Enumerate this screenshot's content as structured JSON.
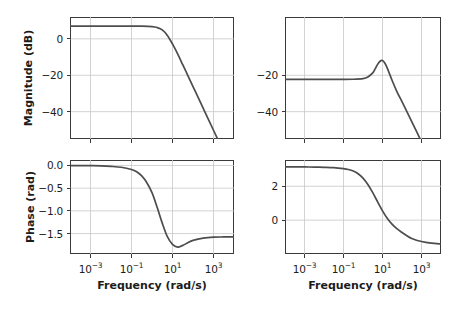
{
  "figure": {
    "type": "bode-plot-grid",
    "rows": 2,
    "cols": 2,
    "background": "#ffffff",
    "curve_color": "#4d4d4d",
    "grid_color": "#c8c8c8",
    "axis_color": "#3a3a3a"
  },
  "axis_titles": {
    "magnitude_y": "Magnitude (dB)",
    "phase_y": "Phase (rad)",
    "frequency_x": "Frequency (rad/s)"
  },
  "xticks": {
    "labels": [
      "10",
      "10",
      "10",
      "10"
    ],
    "exponents": [
      "−3",
      "−1",
      "1",
      "3"
    ],
    "values": [
      0.001,
      0.1,
      10,
      1000
    ]
  },
  "chart_data": [
    {
      "id": "magnitude-left",
      "type": "line",
      "title": "",
      "xlabel": "",
      "ylabel": "Magnitude (dB)",
      "xscale": "log",
      "xlim": [
        0.0001,
        10000
      ],
      "ylim": [
        -55,
        12
      ],
      "yticks": [
        0,
        -20,
        -40
      ],
      "ytick_labels": [
        "0",
        "−20",
        "−40"
      ],
      "xticks": [
        0.001,
        0.1,
        10,
        1000
      ],
      "xtick_labels": [
        "10⁻³",
        "10⁻¹",
        "10¹",
        "10³"
      ],
      "grid": true,
      "legend": "none",
      "series": [
        {
          "name": "Magnitude",
          "x": [
            0.0001,
            0.000316,
            0.001,
            0.00316,
            0.01,
            0.0316,
            0.1,
            0.316,
            1.0,
            1.78,
            3.16,
            5.62,
            10.0,
            17.8,
            31.6,
            56.2,
            100.0,
            178.0,
            316.0,
            562.0,
            1000.0,
            1780.0,
            3160.0,
            5620.0,
            10000.0
          ],
          "y": [
            7.0,
            7.0,
            7.0,
            7.0,
            7.0,
            7.0,
            7.0,
            6.95,
            6.7,
            6.2,
            4.9,
            1.9,
            -2.8,
            -8.3,
            -14.2,
            -20.2,
            -26.2,
            -32.2,
            -38.2,
            -44.2,
            -50.2,
            -56.2,
            -62.2,
            -68.2,
            -74.2
          ]
        }
      ]
    },
    {
      "id": "magnitude-right",
      "type": "line",
      "title": "",
      "xlabel": "",
      "ylabel": "",
      "xscale": "log",
      "xlim": [
        0.0001,
        10000
      ],
      "ylim": [
        -55,
        12
      ],
      "yticks": [
        -20,
        -40
      ],
      "ytick_labels": [
        "−20",
        "−40"
      ],
      "xticks": [
        0.001,
        0.1,
        10,
        1000
      ],
      "xtick_labels": [
        "10⁻³",
        "10⁻¹",
        "10¹",
        "10³"
      ],
      "grid": true,
      "legend": "none",
      "series": [
        {
          "name": "Magnitude",
          "x": [
            0.0001,
            0.000316,
            0.001,
            0.00316,
            0.01,
            0.0316,
            0.1,
            0.316,
            1.0,
            1.78,
            3.16,
            4.2,
            5.62,
            7.5,
            10.0,
            13.3,
            17.8,
            31.6,
            56.2,
            100.0,
            178.0,
            316.0,
            562.0,
            1000.0,
            1780.0,
            3160.0,
            5620.0,
            10000.0
          ],
          "y": [
            -22.3,
            -22.3,
            -22.3,
            -22.3,
            -22.3,
            -22.3,
            -22.3,
            -22.2,
            -21.8,
            -20.9,
            -18.7,
            -16.5,
            -14.0,
            -12.3,
            -11.9,
            -13.4,
            -16.2,
            -23.0,
            -29.2,
            -34.5,
            -40.0,
            -45.5,
            -51.0,
            -56.5,
            -62.0,
            -67.5,
            -73.0,
            -78.5
          ]
        }
      ]
    },
    {
      "id": "phase-left",
      "type": "line",
      "title": "",
      "xlabel": "Frequency (rad/s)",
      "ylabel": "Phase (rad)",
      "xscale": "log",
      "xlim": [
        0.0001,
        10000
      ],
      "ylim": [
        -1.95,
        0.12
      ],
      "yticks": [
        0.0,
        -0.5,
        -1.0,
        -1.5
      ],
      "ytick_labels": [
        "0.0",
        "−0.5",
        "−1.0",
        "−1.5"
      ],
      "xticks": [
        0.001,
        0.1,
        10,
        1000
      ],
      "xtick_labels": [
        "10⁻³",
        "10⁻¹",
        "10¹",
        "10³"
      ],
      "grid": true,
      "legend": "none",
      "series": [
        {
          "name": "Phase",
          "x": [
            0.0001,
            0.000316,
            0.001,
            0.00316,
            0.01,
            0.0316,
            0.1,
            0.178,
            0.316,
            0.562,
            1.0,
            1.78,
            3.16,
            5.62,
            10.0,
            17.8,
            31.6,
            56.2,
            100.0,
            316.0,
            1000.0,
            3160.0,
            10000.0
          ],
          "y": [
            -0.002,
            -0.003,
            -0.005,
            -0.009,
            -0.02,
            -0.04,
            -0.09,
            -0.14,
            -0.23,
            -0.38,
            -0.6,
            -0.92,
            -1.27,
            -1.57,
            -1.74,
            -1.8,
            -1.76,
            -1.7,
            -1.65,
            -1.6,
            -1.58,
            -1.575,
            -1.572
          ]
        }
      ]
    },
    {
      "id": "phase-right",
      "type": "line",
      "title": "",
      "xlabel": "Frequency (rad/s)",
      "ylabel": "",
      "xscale": "log",
      "xlim": [
        0.0001,
        10000
      ],
      "ylim": [
        -2.0,
        3.55
      ],
      "yticks": [
        2,
        0
      ],
      "ytick_labels": [
        "2",
        "0"
      ],
      "xticks": [
        0.001,
        0.1,
        10,
        1000
      ],
      "xtick_labels": [
        "10⁻³",
        "10⁻¹",
        "10¹",
        "10³"
      ],
      "grid": true,
      "legend": "none",
      "series": [
        {
          "name": "Phase",
          "x": [
            0.0001,
            0.000316,
            0.001,
            0.00316,
            0.01,
            0.0316,
            0.1,
            0.178,
            0.316,
            0.562,
            1.0,
            1.78,
            3.16,
            5.62,
            10.0,
            17.8,
            31.6,
            56.2,
            100.0,
            178.0,
            316.0,
            1000.0,
            3160.0,
            10000.0
          ],
          "y": [
            3.14,
            3.14,
            3.14,
            3.13,
            3.12,
            3.1,
            3.04,
            2.99,
            2.9,
            2.74,
            2.48,
            2.1,
            1.62,
            1.08,
            0.55,
            0.1,
            -0.25,
            -0.52,
            -0.73,
            -0.92,
            -1.08,
            -1.26,
            -1.36,
            -1.41
          ]
        }
      ]
    }
  ]
}
